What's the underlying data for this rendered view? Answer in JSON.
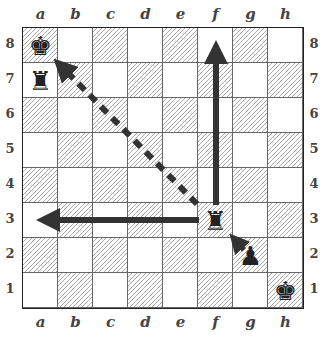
{
  "diagram": {
    "type": "chess-board",
    "files": [
      "a",
      "b",
      "c",
      "d",
      "e",
      "f",
      "g",
      "h"
    ],
    "ranks": [
      "8",
      "7",
      "6",
      "5",
      "4",
      "3",
      "2",
      "1"
    ],
    "colors": {
      "border": "#222222",
      "hatch": "#aaaaaa",
      "arrow": "#333333"
    },
    "pieces": [
      {
        "square": "a8",
        "piece": "king",
        "color": "black",
        "glyph": "♚"
      },
      {
        "square": "a7",
        "piece": "rook",
        "color": "black",
        "glyph": "♜"
      },
      {
        "square": "f3",
        "piece": "rook",
        "color": "black",
        "glyph": "♜"
      },
      {
        "square": "g2",
        "piece": "pawn",
        "color": "black",
        "glyph": "♟"
      },
      {
        "square": "h1",
        "piece": "king",
        "color": "black",
        "glyph": "♚"
      }
    ],
    "arrows": [
      {
        "name": "rook-up-arrow",
        "from": "f3",
        "to": "f8",
        "style": "solid"
      },
      {
        "name": "rook-left-arrow",
        "from": "f3",
        "to": "a3",
        "style": "solid"
      },
      {
        "name": "rook-diagonal-arrow",
        "from": "f3",
        "to": "a8",
        "style": "dashed"
      },
      {
        "name": "pawn-arrow",
        "from": "g2",
        "to": "f3",
        "style": "solid"
      }
    ]
  }
}
